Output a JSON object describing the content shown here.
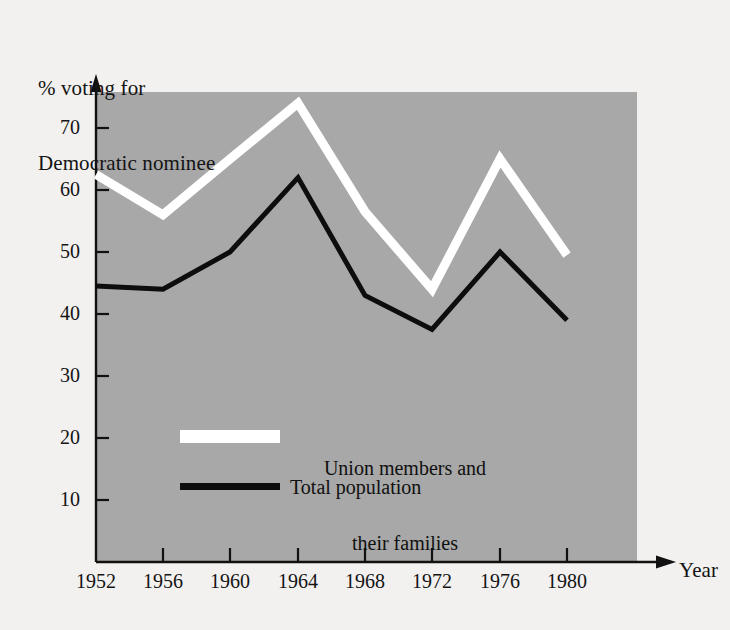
{
  "chart_data": {
    "type": "line",
    "title": "",
    "ylabel": "% voting for\nDemocratic nominee",
    "xlabel": "Year",
    "categories": [
      "1952",
      "1956",
      "1960",
      "1964",
      "1968",
      "1972",
      "1976",
      "1980"
    ],
    "x": [
      1952,
      1956,
      1960,
      1964,
      1968,
      1972,
      1976,
      1980
    ],
    "xtick_labels": [
      "1952",
      "1956",
      "1960",
      "1964",
      "1968",
      "1972",
      "1976",
      "1980"
    ],
    "ytick_labels": [
      "10",
      "20",
      "30",
      "40",
      "50",
      "60",
      "70"
    ],
    "yticks": [
      10,
      20,
      30,
      40,
      50,
      60,
      70
    ],
    "ylim": [
      0,
      78
    ],
    "xlim": [
      1950,
      1984
    ],
    "grid": false,
    "legend_position": "inside-center-left",
    "plot_background_color": "#a8a8a8",
    "page_background_color": "#f2f1ef",
    "series": [
      {
        "name": "Union members and\ntheir families",
        "legend_label_line1": "Union members and",
        "legend_label_line2": "their families",
        "color": "#ffffff",
        "values": [
          62.5,
          56,
          65,
          74,
          56.5,
          44,
          65,
          49.5
        ]
      },
      {
        "name": "Total population",
        "legend_label_line1": "Total population",
        "legend_label_line2": "",
        "color": "#0d0d0d",
        "values": [
          44.5,
          44,
          50,
          62,
          43,
          37.5,
          50,
          39
        ]
      }
    ]
  },
  "axes": {
    "y_axis_title_line1": "% voting for",
    "y_axis_title_line2": "Democratic nominee",
    "x_axis_title": "Year"
  },
  "ticks": {
    "y": [
      {
        "label": "70",
        "value": 70
      },
      {
        "label": "60",
        "value": 60
      },
      {
        "label": "50",
        "value": 50
      },
      {
        "label": "40",
        "value": 40
      },
      {
        "label": "30",
        "value": 30
      },
      {
        "label": "20",
        "value": 20
      },
      {
        "label": "10",
        "value": 10
      }
    ],
    "x": [
      {
        "label": "1952"
      },
      {
        "label": "1956"
      },
      {
        "label": "1960"
      },
      {
        "label": "1964"
      },
      {
        "label": "1968"
      },
      {
        "label": "1972"
      },
      {
        "label": "1976"
      },
      {
        "label": "1980"
      }
    ]
  },
  "legend": {
    "items": [
      {
        "label_line1": "Union members and",
        "label_line2": "their families",
        "swatch_color": "#ffffff"
      },
      {
        "label_line1": "Total population",
        "label_line2": "",
        "swatch_color": "#0d0d0d"
      }
    ]
  }
}
